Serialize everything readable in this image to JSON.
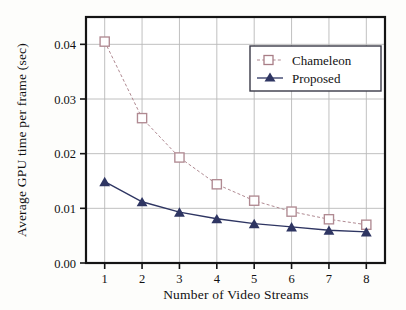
{
  "chart_data": {
    "type": "line",
    "title": "",
    "xlabel": "Number of Video Streams",
    "ylabel": "Average GPU time per frame (sec)",
    "x": [
      1,
      2,
      3,
      4,
      5,
      6,
      7,
      8
    ],
    "xtick_labels": [
      "1",
      "2",
      "3",
      "4",
      "5",
      "6",
      "7",
      "8"
    ],
    "ytick_labels": [
      "0.00",
      "0.01",
      "0.02",
      "0.03",
      "0.04"
    ],
    "ytick_values": [
      0.0,
      0.01,
      0.02,
      0.03,
      0.04
    ],
    "xlim": [
      0.5,
      8.5
    ],
    "ylim": [
      0.0,
      0.045
    ],
    "grid": true,
    "legend_position": "upper right",
    "series": [
      {
        "name": "Chameleon",
        "values": [
          0.0405,
          0.0265,
          0.0193,
          0.0144,
          0.0114,
          0.0094,
          0.008,
          0.007
        ],
        "color": "#b08a92",
        "marker": "open-square",
        "linestyle": "dashed"
      },
      {
        "name": "Proposed",
        "values": [
          0.0149,
          0.0112,
          0.0093,
          0.0081,
          0.0072,
          0.0066,
          0.006,
          0.0057
        ],
        "color": "#2e3562",
        "marker": "filled-triangle",
        "linestyle": "solid"
      }
    ]
  },
  "legend": {
    "entries": [
      {
        "label": "Chameleon"
      },
      {
        "label": "Proposed"
      }
    ]
  },
  "axes": {
    "y_title": "Average GPU time per frame (sec)",
    "x_title": "Number of Video Streams",
    "y_labels": [
      "0.04",
      "0.03",
      "0.02",
      "0.01",
      "0.00"
    ],
    "x_labels": [
      "1",
      "2",
      "3",
      "4",
      "5",
      "6",
      "7",
      "8"
    ]
  },
  "colors": {
    "chameleon": "#b08a92",
    "proposed": "#2e3562",
    "frame": "#141414",
    "grid": "#b9b9b9",
    "background": "#fdfdfb"
  }
}
